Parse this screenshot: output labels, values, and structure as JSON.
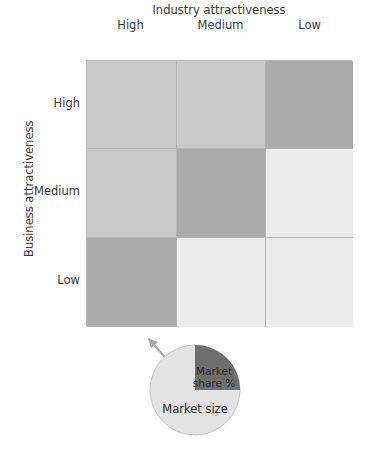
{
  "chart_data": {
    "type": "table",
    "x_axis": {
      "title": "Industry attractiveness",
      "labels": [
        "High",
        "Medium",
        "Low"
      ]
    },
    "y_axis": {
      "title": "Business attractiveness",
      "labels": [
        "High",
        "Medium",
        "Low"
      ]
    },
    "cells": [
      [
        {
          "shade": "medium",
          "color": "#c9c9c9"
        },
        {
          "shade": "medium",
          "color": "#c9c9c9"
        },
        {
          "shade": "dark",
          "color": "#ababab"
        }
      ],
      [
        {
          "shade": "medium",
          "color": "#c9c9c9"
        },
        {
          "shade": "dark",
          "color": "#ababab"
        },
        {
          "shade": "light",
          "color": "#ebebeb"
        }
      ],
      [
        {
          "shade": "dark",
          "color": "#ababab"
        },
        {
          "shade": "light",
          "color": "#ebebeb"
        },
        {
          "shade": "light",
          "color": "#ebebeb"
        }
      ]
    ],
    "legend_pie": {
      "slices": [
        {
          "label": "Market share %",
          "fraction": 0.25,
          "color": "#6e6e6e"
        },
        {
          "label": "Market size",
          "fraction": 0.75,
          "color": "#e3e3e3"
        }
      ],
      "arrow": "pointing up-left from pie"
    }
  },
  "labels": {
    "x_title": "Industry attractiveness",
    "y_title": "Business attractiveness",
    "cols": [
      "High",
      "Medium",
      "Low"
    ],
    "rows": [
      "High",
      "Medium",
      "Low"
    ],
    "pie_share": [
      "Market",
      "share %"
    ],
    "pie_size": "Market size"
  }
}
